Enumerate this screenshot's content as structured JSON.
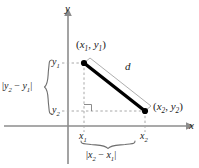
{
  "figure": {
    "kind": "distance-formula-diagram",
    "background_color": "#ffffff",
    "axis_color": "#8c8c8c",
    "segment_color": "#000000",
    "segment_highlight_color": "#9a9a9a",
    "dashed_color": "#a8a8a8",
    "brace_color": "#6e6e6e",
    "text_color": "#1a1a1a"
  },
  "axes": {
    "x_label": "x",
    "y_label": "y",
    "x_axis_y_px": 126,
    "y_axis_x_px": 68
  },
  "points": [
    {
      "name": "point-1",
      "label_prefix": "(",
      "label_x": "x",
      "label_x_sub": "1",
      "label_sep": ", ",
      "label_y": "y",
      "label_y_sub": "1",
      "label_suffix": ")",
      "label_text": "(x1, y1)",
      "px": 84,
      "py": 63
    },
    {
      "name": "point-2",
      "label_prefix": "(",
      "label_x": "x",
      "label_x_sub": "2",
      "label_sep": ", ",
      "label_y": "y",
      "label_y_sub": "2",
      "label_suffix": ")",
      "label_text": "(x2, y2)",
      "px": 145,
      "py": 111
    }
  ],
  "segment": {
    "name": "distance-segment",
    "label": "d"
  },
  "ticks": {
    "y1": {
      "var": "y",
      "sub": "1",
      "text": "y1"
    },
    "y2": {
      "var": "y",
      "sub": "2",
      "text": "y2"
    },
    "x1": {
      "var": "x",
      "sub": "1",
      "text": "x1"
    },
    "x2": {
      "var": "x",
      "sub": "2",
      "text": "x2"
    }
  },
  "braces": {
    "vertical": {
      "name": "vertical-brace",
      "bar": "|",
      "var_a": "y",
      "sub_a": "2",
      "minus": " − ",
      "var_b": "y",
      "sub_b": "1",
      "text": "|y2 − y1|"
    },
    "horizontal": {
      "name": "horizontal-brace",
      "bar": "|",
      "var_a": "x",
      "sub_a": "2",
      "minus": " − ",
      "var_b": "x",
      "sub_b": "1",
      "text": "|x2 − x1|"
    }
  },
  "markers": {
    "right_angle": "right-angle-marker"
  }
}
